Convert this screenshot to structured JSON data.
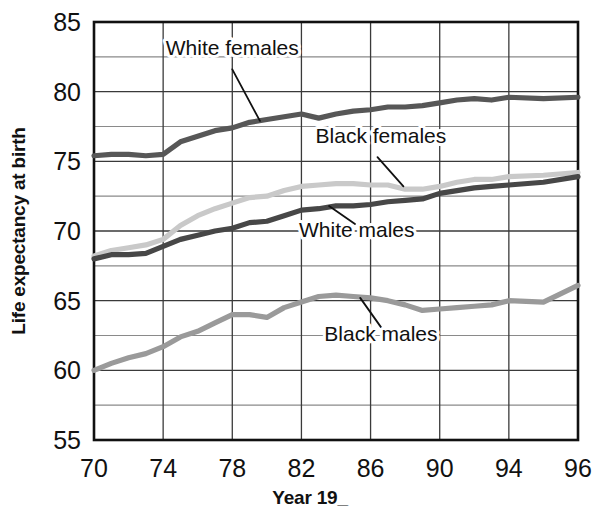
{
  "chart_data": {
    "type": "line",
    "title": "",
    "xlabel": "Year 19_",
    "ylabel": "Life expectancy at birth",
    "xlim": [
      70,
      96
    ],
    "ylim": [
      55,
      85
    ],
    "ytick_labels": [
      "55",
      "60",
      "65",
      "70",
      "75",
      "80",
      "85"
    ],
    "yticks": [
      55,
      60,
      65,
      70,
      75,
      80,
      85
    ],
    "y_minor_step": 2.5,
    "xtick_labels": [
      "70",
      "74",
      "78",
      "82",
      "86",
      "90",
      "94",
      "96"
    ],
    "xticks": [
      70,
      74,
      78,
      82,
      86,
      90,
      94,
      96
    ],
    "grid": true,
    "legend": "inline-annotations",
    "x": [
      70,
      71,
      72,
      73,
      74,
      75,
      76,
      77,
      78,
      79,
      80,
      81,
      82,
      83,
      84,
      85,
      86,
      87,
      88,
      89,
      90,
      91,
      92,
      93,
      94,
      95,
      96
    ],
    "series": [
      {
        "name": "White females",
        "color": "#575757",
        "values": [
          75.4,
          75.5,
          75.5,
          75.4,
          75.5,
          76.4,
          76.8,
          77.2,
          77.4,
          77.8,
          78.0,
          78.2,
          78.4,
          78.1,
          78.4,
          78.6,
          78.7,
          78.9,
          78.9,
          79.0,
          79.2,
          79.4,
          79.5,
          79.4,
          79.6,
          79.5,
          79.6
        ],
        "label_x": 78,
        "label_y": 82.6
      },
      {
        "name": "Black females",
        "color": "#c9c9c9",
        "values": [
          68.2,
          68.6,
          68.8,
          69.0,
          69.4,
          70.4,
          71.1,
          71.6,
          72.0,
          72.4,
          72.5,
          72.9,
          73.2,
          73.3,
          73.4,
          73.4,
          73.3,
          73.3,
          73.0,
          73.0,
          73.2,
          73.5,
          73.7,
          73.7,
          73.9,
          74.0,
          74.2
        ],
        "label_x": 86.6,
        "label_y": 76.3
      },
      {
        "name": "White males",
        "color": "#474747",
        "values": [
          68.0,
          68.3,
          68.3,
          68.4,
          68.9,
          69.4,
          69.7,
          70.0,
          70.2,
          70.6,
          70.7,
          71.1,
          71.5,
          71.6,
          71.8,
          71.8,
          71.9,
          72.1,
          72.2,
          72.3,
          72.7,
          72.9,
          73.1,
          73.2,
          73.3,
          73.5,
          73.9
        ],
        "label_x": 85.2,
        "label_y": 69.6
      },
      {
        "name": "Black males",
        "color": "#9a9a9a",
        "values": [
          60.0,
          60.5,
          60.9,
          61.2,
          61.7,
          62.4,
          62.8,
          63.4,
          64.0,
          64.0,
          63.8,
          64.5,
          64.9,
          65.3,
          65.4,
          65.3,
          65.2,
          65.0,
          64.7,
          64.3,
          64.4,
          64.5,
          64.6,
          64.7,
          65.0,
          64.9,
          66.1
        ],
        "label_x": 86.6,
        "label_y": 62.1
      }
    ],
    "annotations": [
      {
        "text": "White females",
        "leader_from": [
          78.0,
          81.6
        ],
        "leader_to": [
          79.6,
          77.9
        ]
      },
      {
        "text": "Black females",
        "leader_from": [
          86.4,
          75.3
        ],
        "leader_to": [
          87.9,
          73.2
        ]
      },
      {
        "text": "White males",
        "leader_from": [
          85.1,
          70.5
        ],
        "leader_to": [
          83.6,
          71.8
        ]
      },
      {
        "text": "Black males",
        "leader_from": [
          86.6,
          63.1
        ],
        "leader_to": [
          85.4,
          65.2
        ]
      }
    ]
  },
  "plot": {
    "frame_color": "#111111",
    "grid_minor_color": "#8a8a8a",
    "grid_major_color": "#3a3a3a",
    "background": "#ffffff"
  }
}
